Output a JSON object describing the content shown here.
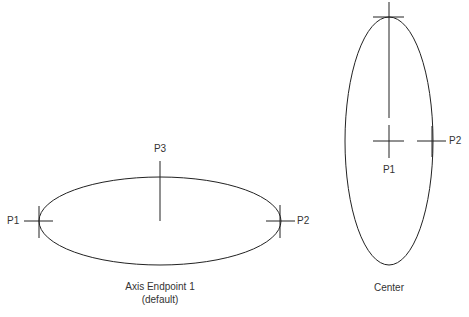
{
  "left_diagram": {
    "points": {
      "p1": "P1",
      "p2": "P2",
      "p3": "P3"
    },
    "caption_line1": "Axis Endpoint 1",
    "caption_line2": "(default)"
  },
  "right_diagram": {
    "points": {
      "p1": "P1",
      "p2": "P2"
    },
    "caption": "Center"
  },
  "colors": {
    "stroke": "#222222",
    "text": "#333333",
    "background": "#ffffff"
  }
}
